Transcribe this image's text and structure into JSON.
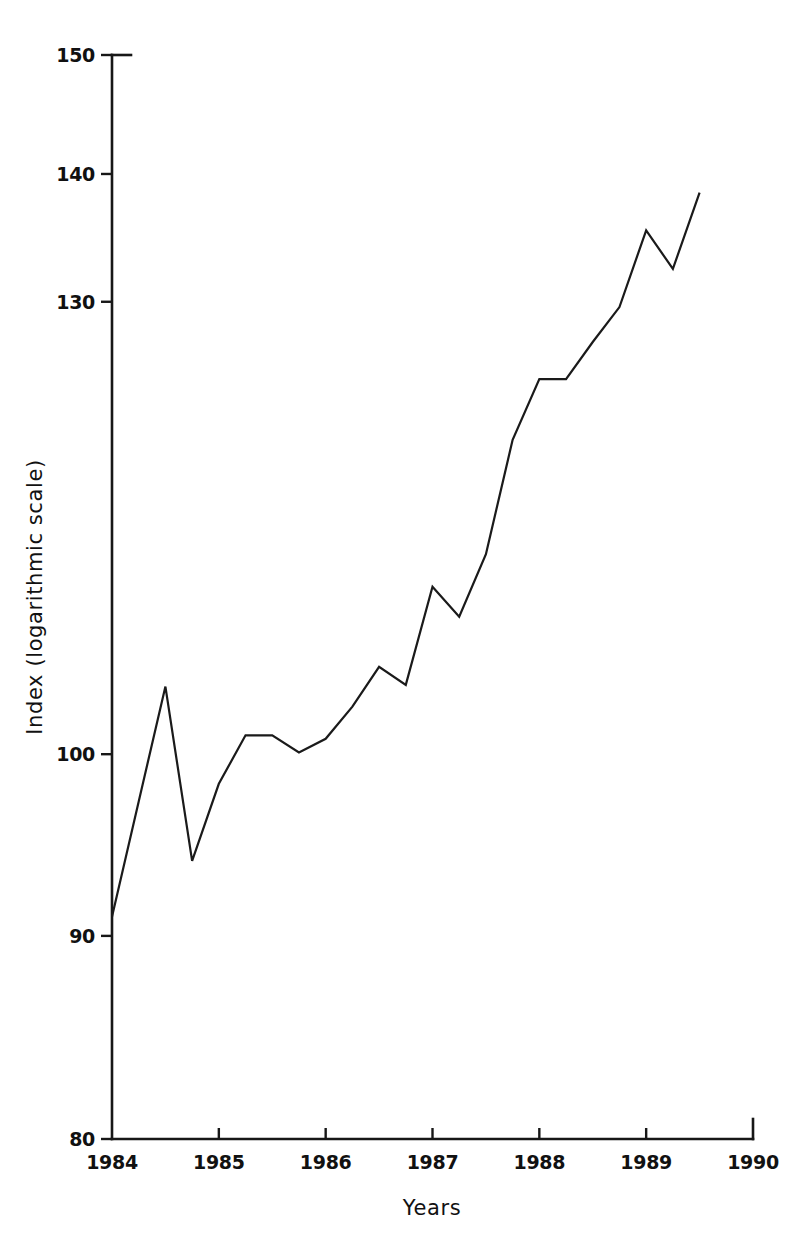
{
  "chart_data": {
    "type": "line",
    "title": "",
    "xlabel": "Years",
    "ylabel": "Index (logarithmic scale)",
    "yscale": "log",
    "ylim": [
      80,
      150
    ],
    "xlim": [
      1984,
      1990
    ],
    "grid": false,
    "legend": false,
    "yticks": [
      80,
      90,
      100,
      130,
      140,
      150
    ],
    "ytick_labels": [
      "80",
      "90",
      "100",
      "130",
      "140",
      "150"
    ],
    "xticks": [
      1984,
      1985,
      1986,
      1987,
      1988,
      1989,
      1990
    ],
    "xtick_labels": [
      "1984",
      "1985",
      "1986",
      "1987",
      "1988",
      "1989",
      "1990"
    ],
    "series": [
      {
        "name": "Index",
        "color": "#1a1a1a",
        "x": [
          1984.0,
          1984.25,
          1984.5,
          1984.75,
          1985.0,
          1985.25,
          1985.5,
          1985.75,
          1986.0,
          1986.25,
          1986.5,
          1986.75,
          1987.0,
          1987.25,
          1987.5,
          1987.75,
          1988.0,
          1988.25,
          1988.5,
          1988.75,
          1989.0,
          1989.25,
          1989.5
        ],
        "y": [
          91.0,
          97.3,
          104.0,
          94.0,
          98.3,
          101.1,
          101.1,
          100.1,
          100.9,
          102.8,
          105.2,
          104.1,
          110.2,
          108.3,
          112.3,
          120.0,
          124.3,
          124.3,
          127.0,
          129.6,
          135.5,
          132.5,
          138.5
        ]
      }
    ]
  },
  "axis_titles": {
    "x": "Years",
    "y": "Index (logarithmic scale)"
  }
}
